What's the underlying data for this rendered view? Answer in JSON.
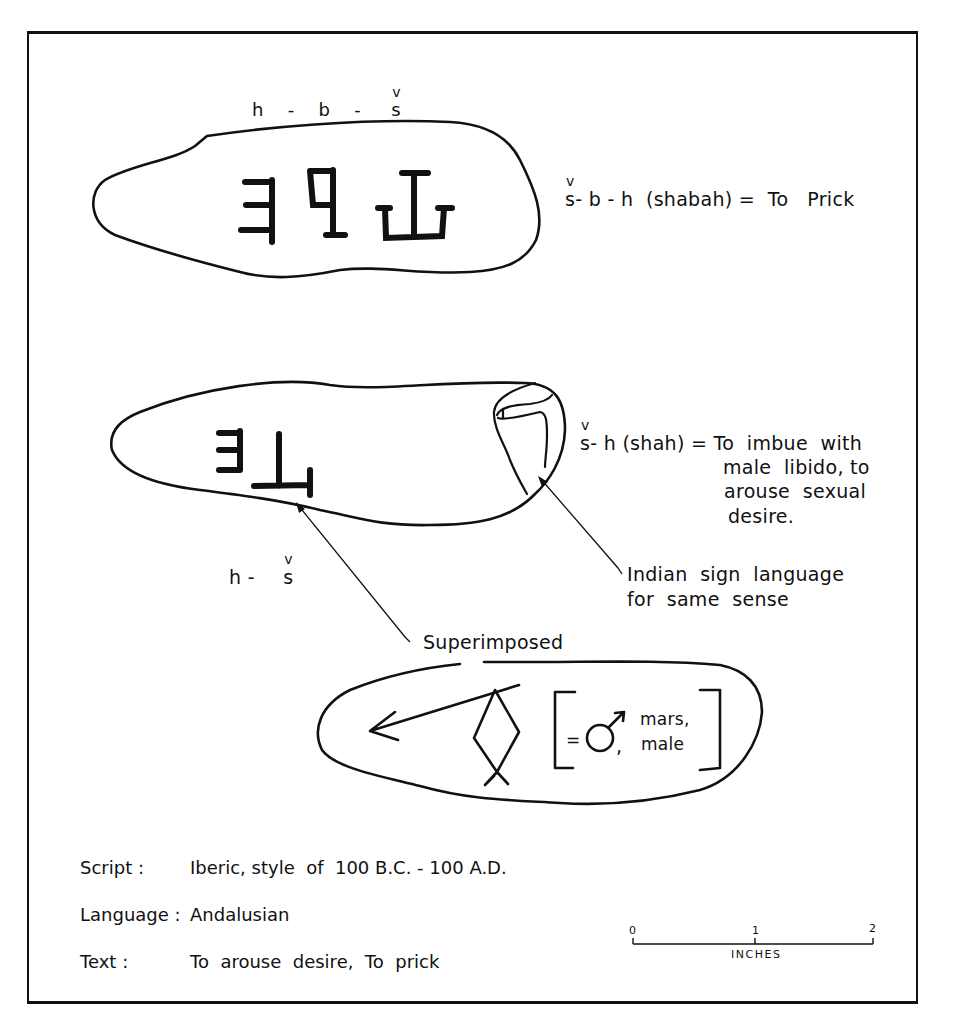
{
  "tablet1": {
    "transliteration_above": [
      "h",
      "-",
      "b",
      "-",
      "s"
    ],
    "caron_letter_index": 4,
    "gloss_root_prefix": "s",
    "gloss": "- b - h  (shabah) =  To   Prick",
    "glyphs": [
      "iberic-e-like",
      "iberic-ba",
      "iberic-sh"
    ]
  },
  "tablet2": {
    "gloss_root_prefix": "s",
    "gloss_line1": "- h (shah) = To  imbue  with",
    "gloss_line2": "male  libido, to",
    "gloss_line3": "arouse  sexual",
    "gloss_line4": "desire.",
    "transliteration_below_h": "h -",
    "transliteration_below_s": "s",
    "sign_callout_line1": "Indian  sign  language",
    "sign_callout_line2": "for  same  sense",
    "superimposed_label": "Superimposed"
  },
  "tablet3": {
    "equals": "=",
    "symbol_comma": ",",
    "meaning_line1": "mars,",
    "meaning_line2": "male"
  },
  "metadata": [
    {
      "key": "Script :",
      "value": "Iberic, style  of  100 B.C. - 100 A.D."
    },
    {
      "key": "Language :",
      "value": "Andalusian"
    },
    {
      "key": "Text :",
      "value": "To  arouse  desire,  To  prick"
    }
  ],
  "scale_bar": {
    "ticks": [
      "0",
      "1",
      "2"
    ],
    "unit": "INCHES"
  }
}
